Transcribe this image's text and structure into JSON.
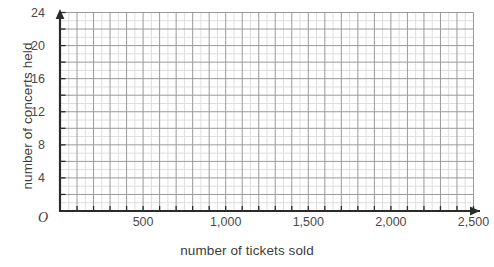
{
  "chart_data": {
    "type": "scatter",
    "title": "",
    "subtitle": "",
    "xlabel": "number of tickets sold",
    "ylabel": "number of concerts held",
    "xlim": [
      0,
      2500
    ],
    "ylim": [
      0,
      24
    ],
    "x_major_tick_step": 500,
    "y_major_tick_step": 4,
    "x_gridline_step": 100,
    "y_gridline_step": 2,
    "x_tick_labels": [
      "500",
      "1,000",
      "1,500",
      "2,000",
      "2,500"
    ],
    "x_tick_values": [
      500,
      1000,
      1500,
      2000,
      2500
    ],
    "y_tick_labels": [
      "4",
      "8",
      "12",
      "16",
      "20",
      "24"
    ],
    "y_tick_values": [
      4,
      8,
      12,
      16,
      20,
      24
    ],
    "origin_label": "O",
    "grid": true,
    "legend": null,
    "series": [],
    "values": [],
    "annotations": [],
    "note": "empty coordinate grid with no plotted data points"
  },
  "style": {
    "background": "#ffffff",
    "axis_color": "#2b2b2b",
    "major_grid_color": "#9a9a9a",
    "minor_grid_color": "#dedede",
    "text_color": "#3c3c3c"
  }
}
